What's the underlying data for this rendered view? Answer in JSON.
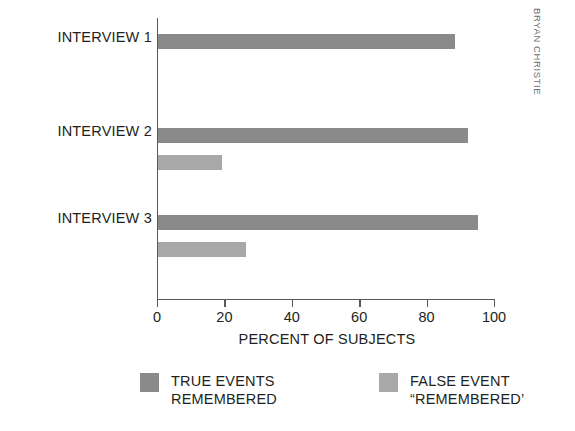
{
  "credit": "BRYAN CHRISTIE",
  "chart_data": {
    "type": "bar",
    "orientation": "horizontal",
    "title": "",
    "xlabel": "PERCENT OF SUBJECTS",
    "ylabel": "",
    "xlim": [
      0,
      100
    ],
    "xticks": [
      0,
      20,
      40,
      60,
      80,
      100
    ],
    "xtick_labels": [
      "0",
      "20",
      "40",
      "60",
      "80",
      "100"
    ],
    "grid": false,
    "legend_position": "bottom",
    "categories": [
      "INTERVIEW 1",
      "INTERVIEW 2",
      "INTERVIEW 3"
    ],
    "series": [
      {
        "name": "TRUE EVENTS REMEMBERED",
        "legend_line1": "TRUE EVENTS",
        "legend_line2": "REMEMBERED",
        "color": "#8a8a8a",
        "values": [
          88,
          92,
          95
        ]
      },
      {
        "name": "FALSE EVENT “REMEMBERED’",
        "legend_line1": "FALSE EVENT",
        "legend_line2": "“REMEMBERED’",
        "color": "#a8a8a8",
        "values": [
          null,
          19,
          26
        ]
      }
    ]
  }
}
